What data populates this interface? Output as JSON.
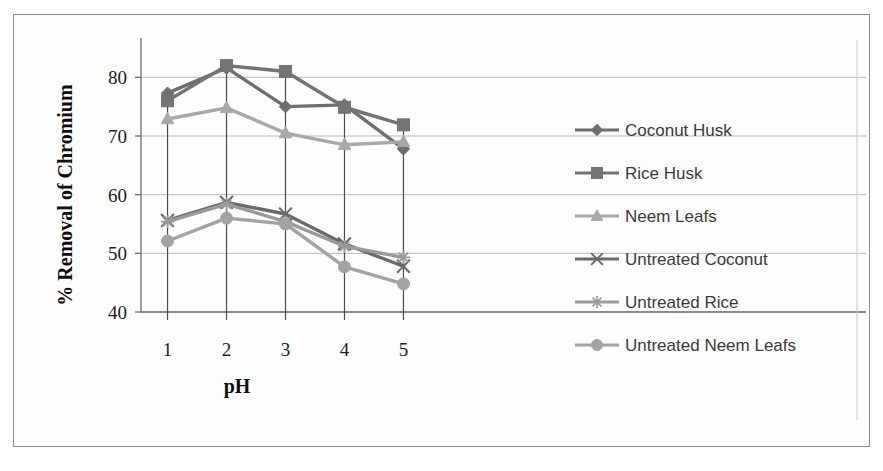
{
  "figure": {
    "has_border": true,
    "background": "#fdfdfd"
  },
  "chart_data": {
    "type": "line",
    "title": "",
    "subtitle": "",
    "xlabel": "pH",
    "ylabel": "% Removal of Chromium",
    "x": [
      1,
      2,
      3,
      4,
      5
    ],
    "categories": [
      "1",
      "2",
      "3",
      "4",
      "5"
    ],
    "xtick_labels": [
      "1",
      "2",
      "3",
      "4",
      "5"
    ],
    "ytick_labels": [
      "40",
      "50",
      "60",
      "70",
      "80"
    ],
    "yticks": [
      40,
      50,
      60,
      70,
      80
    ],
    "ylim": [
      40,
      85
    ],
    "xlim": [
      0.55,
      5.45
    ],
    "grid": "horizontal",
    "drop_lines": true,
    "legend_position": "right",
    "series": [
      {
        "name": "Coconut Husk",
        "marker": "diamond",
        "color": "#6e6e6e",
        "values": [
          77.3,
          81.6,
          75.0,
          75.3,
          67.8
        ]
      },
      {
        "name": "Rice Husk",
        "marker": "square",
        "color": "#737373",
        "values": [
          76.0,
          82.0,
          81.0,
          74.9,
          71.9
        ]
      },
      {
        "name": "Neem Leafs",
        "marker": "triangle",
        "color": "#a8a8a8",
        "values": [
          72.9,
          74.8,
          70.5,
          68.5,
          69.0
        ]
      },
      {
        "name": "Untreated Coconut",
        "marker": "x",
        "color": "#6a6a6a",
        "values": [
          55.6,
          58.7,
          56.7,
          51.6,
          47.8
        ]
      },
      {
        "name": "Untreated Rice",
        "marker": "star",
        "color": "#9a9a9a",
        "values": [
          55.4,
          58.4,
          55.4,
          51.2,
          49.3
        ]
      },
      {
        "name": "Untreated Neem Leafs",
        "marker": "circle",
        "color": "#a3a3a3",
        "values": [
          52.1,
          56.0,
          55.0,
          47.7,
          44.8
        ]
      }
    ]
  },
  "legend": {
    "entries": [
      {
        "label": "Coconut Husk",
        "marker": "diamond-marker",
        "color": "#6e6e6e"
      },
      {
        "label": "Rice Husk",
        "marker": "square-marker",
        "color": "#737373"
      },
      {
        "label": "Neem Leafs",
        "marker": "triangle-marker",
        "color": "#a8a8a8"
      },
      {
        "label": "Untreated Coconut",
        "marker": "x-marker",
        "color": "#6a6a6a"
      },
      {
        "label": "Untreated Rice",
        "marker": "star-marker",
        "color": "#9a9a9a"
      },
      {
        "label": "Untreated Neem Leafs",
        "marker": "circle-marker",
        "color": "#a3a3a3"
      }
    ]
  }
}
